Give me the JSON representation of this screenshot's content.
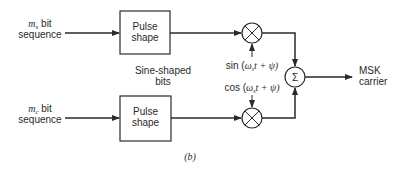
{
  "diagram": {
    "caption": "(b)",
    "inputs": {
      "upper": {
        "symbol": "m",
        "subscript": "s",
        "line1_suffix": " bit",
        "line2": "sequence"
      },
      "lower": {
        "symbol": "m",
        "subscript": "c",
        "line1_suffix": " bit",
        "line2": "sequence"
      }
    },
    "blocks": {
      "upper_pulse_shape": {
        "line1": "Pulse",
        "line2": "shape"
      },
      "lower_pulse_shape": {
        "line1": "Pulse",
        "line2": "shape"
      }
    },
    "annotation": {
      "line1": "Sine-shaped",
      "line2": "bits"
    },
    "carriers": {
      "sin": {
        "func": "sin (",
        "omega": "ω",
        "sub": "s",
        "rest": "t + ψ)"
      },
      "cos": {
        "func": "cos (",
        "omega": "ω",
        "sub": "s",
        "rest": "t + ψ)"
      }
    },
    "summer": {
      "symbol": "Σ"
    },
    "output": {
      "line1": "MSK",
      "line2": "carrier"
    },
    "colors": {
      "ink": "#2a2a2a",
      "background": "#ffffff"
    }
  }
}
